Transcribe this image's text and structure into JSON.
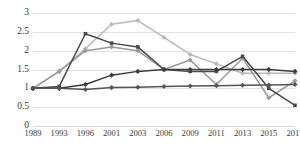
{
  "chart_data": {
    "type": "line",
    "title": "",
    "subtitle": "",
    "xlabel": "",
    "ylabel": "",
    "grid": true,
    "legend": "none",
    "categories": [
      "1989",
      "1993",
      "1996",
      "2001",
      "2003",
      "2006",
      "2009",
      "2011",
      "2013",
      "2015",
      "2017"
    ],
    "x": [
      1989,
      1993,
      1996,
      2001,
      2003,
      2006,
      2009,
      2011,
      2013,
      2015,
      2017
    ],
    "ylim": [
      0,
      3
    ],
    "yticks": [
      0,
      0.5,
      1,
      1.5,
      2,
      2.5,
      3
    ],
    "ytick_labels": [
      "0",
      "0.5",
      "1",
      "1.5",
      "2",
      "2.5",
      "3"
    ],
    "xtick_labels": [
      "1989",
      "1993",
      "1996",
      "2001",
      "2003",
      "2006",
      "2009",
      "2011",
      "2013",
      "2015",
      "2017"
    ],
    "series": [
      {
        "name": "series-light-gray",
        "color": "#b9b9b9",
        "marker": "diamond",
        "values": [
          1.0,
          1.45,
          2.05,
          2.7,
          2.8,
          2.35,
          1.9,
          1.65,
          1.4,
          1.4,
          1.4
        ]
      },
      {
        "name": "series-medium-gray",
        "color": "#9a9a9a",
        "marker": "diamond",
        "values": [
          1.0,
          1.45,
          2.0,
          2.1,
          2.0,
          1.5,
          1.75,
          1.1,
          1.8,
          0.75,
          1.2
        ]
      },
      {
        "name": "series-dark-peak",
        "color": "#4a4a4a",
        "marker": "square",
        "values": [
          1.0,
          1.05,
          2.45,
          2.2,
          2.1,
          1.5,
          1.45,
          1.45,
          1.85,
          1.0,
          0.55
        ]
      },
      {
        "name": "series-dark-rising",
        "color": "#3c3c3c",
        "marker": "diamond",
        "values": [
          1.0,
          1.0,
          1.1,
          1.35,
          1.45,
          1.5,
          1.5,
          1.5,
          1.5,
          1.5,
          1.45
        ]
      },
      {
        "name": "series-dark-flat",
        "color": "#555555",
        "marker": "diamond",
        "values": [
          1.0,
          1.0,
          0.97,
          1.02,
          1.03,
          1.05,
          1.06,
          1.07,
          1.08,
          1.09,
          1.1
        ]
      }
    ]
  }
}
